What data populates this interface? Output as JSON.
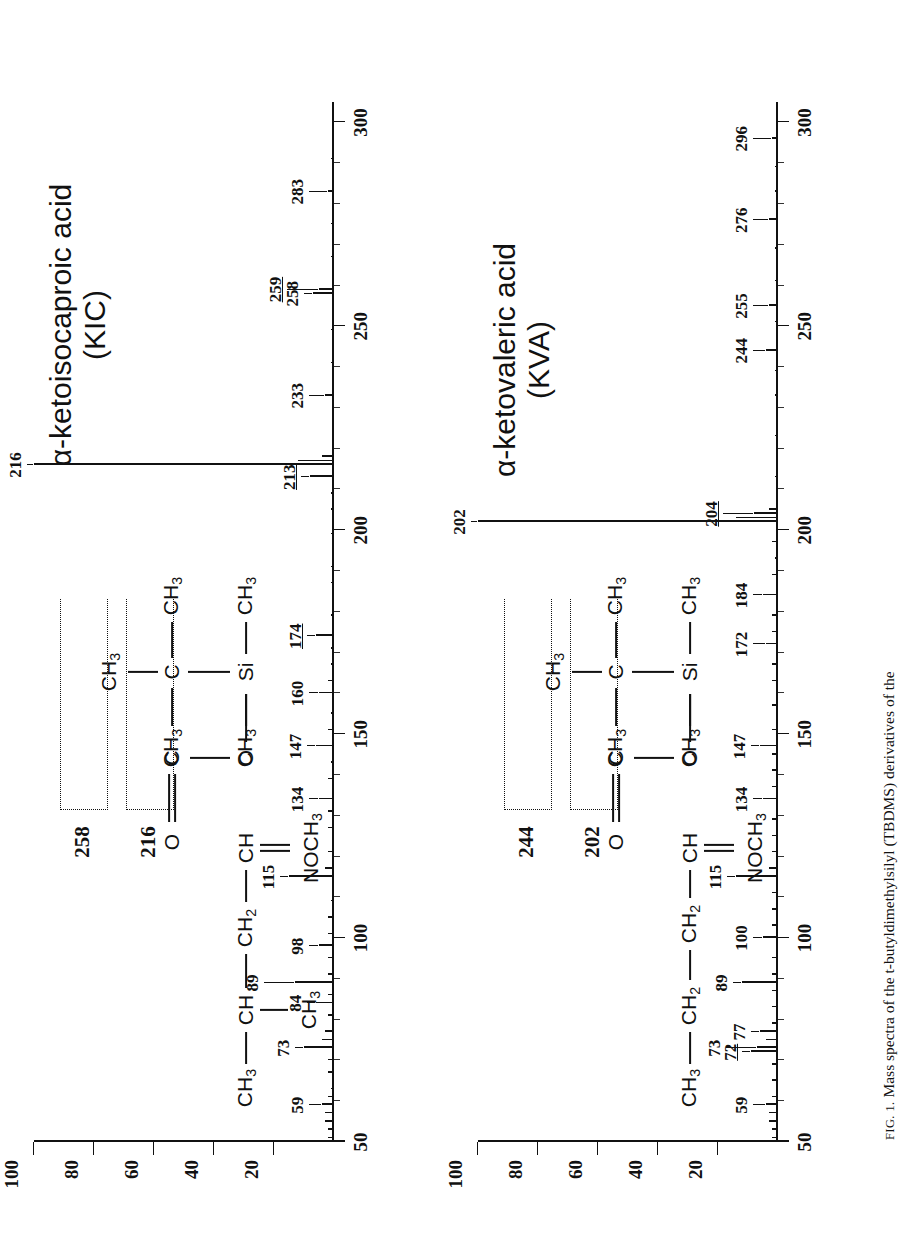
{
  "figure": {
    "caption_prefix": "FIG. 1.",
    "caption_text": "Mass spectra of the t-butyldimethylsilyl (TBDMS) derivatives of the"
  },
  "axes": {
    "y_label_values": [
      "100",
      "80",
      "60",
      "40",
      "20"
    ],
    "y_ticks": [
      100,
      80,
      60,
      40,
      20
    ],
    "x_label_values": [
      "50",
      "100",
      "150",
      "200",
      "250",
      "300"
    ],
    "x_ticks": [
      50,
      100,
      150,
      200,
      250,
      300
    ],
    "x_minor_step": 10,
    "xlim": [
      50,
      305
    ],
    "ylim": [
      0,
      100
    ]
  },
  "panels": [
    {
      "id": "kic",
      "title_line1": "α-ketoisocaproic acid",
      "title_line2": "(KIC)",
      "structure": {
        "chain": [
          "CH",
          "CH",
          "CH",
          "CH",
          "C",
          "O",
          "Si",
          "C",
          "CH"
        ],
        "atoms": {
          "ch3_start": "CH3",
          "ch_branch": "CH",
          "ch3_branch": "CH3",
          "ch2": "CH2",
          "ch_oxime": "CH",
          "nnoch3": "NOCH3",
          "c_carbonyl": "C",
          "o_double": "O",
          "o_single": "O",
          "si": "Si",
          "si_ch3_left": "CH3",
          "si_ch3_right": "CH3",
          "c_quart": "C",
          "c_ch3_left": "CH3",
          "c_ch3_right": "CH3",
          "c_ch3_top": "CH3"
        },
        "fragment_labels": [
          "216",
          "258"
        ]
      },
      "chart_data": {
        "type": "bar",
        "title": "α-ketoisocaproic acid (KIC)",
        "xlabel": "m/z",
        "ylabel": "Relative abundance (%)",
        "xlim": [
          50,
          305
        ],
        "ylim": [
          0,
          100
        ],
        "grid": false,
        "labeled_peaks": [
          {
            "mz": 59,
            "intensity": 4,
            "label": "59",
            "underline": false
          },
          {
            "mz": 73,
            "intensity": 10,
            "label": "73",
            "underline": false
          },
          {
            "mz": 84,
            "intensity": 6,
            "label": "84",
            "underline": false
          },
          {
            "mz": 89,
            "intensity": 13,
            "label": "89",
            "underline": false
          },
          {
            "mz": 98,
            "intensity": 5,
            "label": "98",
            "underline": false
          },
          {
            "mz": 115,
            "intensity": 15,
            "label": "115",
            "underline": false
          },
          {
            "mz": 134,
            "intensity": 5,
            "label": "134",
            "underline": false
          },
          {
            "mz": 147,
            "intensity": 6,
            "label": "147",
            "underline": false
          },
          {
            "mz": 160,
            "intensity": 5,
            "label": "160",
            "underline": false
          },
          {
            "mz": 174,
            "intensity": 6,
            "label": "174",
            "underline": true
          },
          {
            "mz": 213,
            "intensity": 8,
            "label": "213",
            "underline": true
          },
          {
            "mz": 216,
            "intensity": 100,
            "label": "216",
            "underline": false
          },
          {
            "mz": 233,
            "intensity": 3,
            "label": "233",
            "underline": false
          },
          {
            "mz": 258,
            "intensity": 7,
            "label": "258",
            "underline": false
          },
          {
            "mz": 259,
            "intensity": 5,
            "label": "259",
            "underline": true
          },
          {
            "mz": 283,
            "intensity": 2,
            "label": "283",
            "underline": false
          }
        ],
        "minor_peaks": [
          {
            "mz": 51,
            "intensity": 2
          },
          {
            "mz": 53,
            "intensity": 2
          },
          {
            "mz": 55,
            "intensity": 3
          },
          {
            "mz": 57,
            "intensity": 3
          },
          {
            "mz": 61,
            "intensity": 2
          },
          {
            "mz": 63,
            "intensity": 1
          },
          {
            "mz": 67,
            "intensity": 2
          },
          {
            "mz": 70,
            "intensity": 2
          },
          {
            "mz": 75,
            "intensity": 4
          },
          {
            "mz": 77,
            "intensity": 3
          },
          {
            "mz": 81,
            "intensity": 2
          },
          {
            "mz": 86,
            "intensity": 2
          },
          {
            "mz": 91,
            "intensity": 2
          },
          {
            "mz": 95,
            "intensity": 2
          },
          {
            "mz": 101,
            "intensity": 2
          },
          {
            "mz": 105,
            "intensity": 2
          },
          {
            "mz": 109,
            "intensity": 1
          },
          {
            "mz": 117,
            "intensity": 3
          },
          {
            "mz": 121,
            "intensity": 2
          },
          {
            "mz": 127,
            "intensity": 2
          },
          {
            "mz": 131,
            "intensity": 2
          },
          {
            "mz": 139,
            "intensity": 2
          },
          {
            "mz": 143,
            "intensity": 1
          },
          {
            "mz": 151,
            "intensity": 2
          },
          {
            "mz": 155,
            "intensity": 1
          },
          {
            "mz": 163,
            "intensity": 2
          },
          {
            "mz": 167,
            "intensity": 1
          },
          {
            "mz": 171,
            "intensity": 1
          },
          {
            "mz": 179,
            "intensity": 1
          },
          {
            "mz": 187,
            "intensity": 1
          },
          {
            "mz": 191,
            "intensity": 1
          },
          {
            "mz": 199,
            "intensity": 1
          },
          {
            "mz": 205,
            "intensity": 1
          },
          {
            "mz": 209,
            "intensity": 1
          },
          {
            "mz": 217,
            "intensity": 12
          },
          {
            "mz": 218,
            "intensity": 4
          },
          {
            "mz": 241,
            "intensity": 1
          },
          {
            "mz": 249,
            "intensity": 1
          },
          {
            "mz": 267,
            "intensity": 1
          },
          {
            "mz": 275,
            "intensity": 1
          },
          {
            "mz": 291,
            "intensity": 1
          }
        ]
      }
    },
    {
      "id": "kva",
      "title_line1": "α-ketovaleric acid",
      "title_line2": "(KVA)",
      "structure": {
        "atoms": {
          "ch3_start": "CH3",
          "ch2_a": "CH2",
          "ch2_b": "CH2",
          "ch_oxime": "CH",
          "nnoch3": "NOCH3",
          "c_carbonyl": "C",
          "o_double": "O",
          "o_single": "O",
          "si": "Si",
          "si_ch3_left": "CH3",
          "si_ch3_right": "CH3",
          "c_quart": "C",
          "c_ch3_left": "CH3",
          "c_ch3_right": "CH3",
          "c_ch3_top": "CH3"
        },
        "fragment_labels": [
          "202",
          "244"
        ]
      },
      "chart_data": {
        "type": "bar",
        "title": "α-ketovaleric acid (KVA)",
        "xlabel": "m/z",
        "ylabel": "Relative abundance (%)",
        "xlim": [
          50,
          305
        ],
        "ylim": [
          0,
          100
        ],
        "grid": false,
        "labeled_peaks": [
          {
            "mz": 59,
            "intensity": 4,
            "label": "59",
            "underline": false
          },
          {
            "mz": 72,
            "intensity": 9,
            "label": "72",
            "underline": true
          },
          {
            "mz": 73,
            "intensity": 7,
            "label": "73",
            "underline": false
          },
          {
            "mz": 77,
            "intensity": 6,
            "label": "77",
            "underline": false
          },
          {
            "mz": 89,
            "intensity": 12,
            "label": "89",
            "underline": false
          },
          {
            "mz": 100,
            "intensity": 5,
            "label": "100",
            "underline": false
          },
          {
            "mz": 115,
            "intensity": 14,
            "label": "115",
            "underline": false
          },
          {
            "mz": 134,
            "intensity": 5,
            "label": "134",
            "underline": false
          },
          {
            "mz": 147,
            "intensity": 6,
            "label": "147",
            "underline": false
          },
          {
            "mz": 172,
            "intensity": 4,
            "label": "172",
            "underline": false
          },
          {
            "mz": 184,
            "intensity": 5,
            "label": "184",
            "underline": false
          },
          {
            "mz": 202,
            "intensity": 100,
            "label": "202",
            "underline": false
          },
          {
            "mz": 204,
            "intensity": 8,
            "label": "204",
            "underline": true
          },
          {
            "mz": 244,
            "intensity": 4,
            "label": "244",
            "underline": false
          },
          {
            "mz": 255,
            "intensity": 3,
            "label": "255",
            "underline": false
          },
          {
            "mz": 276,
            "intensity": 3,
            "label": "276",
            "underline": false
          },
          {
            "mz": 296,
            "intensity": 2,
            "label": "296",
            "underline": false
          }
        ],
        "minor_peaks": [
          {
            "mz": 51,
            "intensity": 2
          },
          {
            "mz": 53,
            "intensity": 2
          },
          {
            "mz": 55,
            "intensity": 3
          },
          {
            "mz": 57,
            "intensity": 3
          },
          {
            "mz": 61,
            "intensity": 2
          },
          {
            "mz": 65,
            "intensity": 2
          },
          {
            "mz": 69,
            "intensity": 2
          },
          {
            "mz": 75,
            "intensity": 4
          },
          {
            "mz": 79,
            "intensity": 2
          },
          {
            "mz": 83,
            "intensity": 2
          },
          {
            "mz": 87,
            "intensity": 2
          },
          {
            "mz": 91,
            "intensity": 2
          },
          {
            "mz": 95,
            "intensity": 2
          },
          {
            "mz": 103,
            "intensity": 2
          },
          {
            "mz": 107,
            "intensity": 2
          },
          {
            "mz": 111,
            "intensity": 2
          },
          {
            "mz": 117,
            "intensity": 3
          },
          {
            "mz": 121,
            "intensity": 2
          },
          {
            "mz": 125,
            "intensity": 2
          },
          {
            "mz": 129,
            "intensity": 2
          },
          {
            "mz": 137,
            "intensity": 2
          },
          {
            "mz": 141,
            "intensity": 2
          },
          {
            "mz": 145,
            "intensity": 2
          },
          {
            "mz": 151,
            "intensity": 2
          },
          {
            "mz": 157,
            "intensity": 2
          },
          {
            "mz": 163,
            "intensity": 2
          },
          {
            "mz": 167,
            "intensity": 2
          },
          {
            "mz": 175,
            "intensity": 2
          },
          {
            "mz": 179,
            "intensity": 2
          },
          {
            "mz": 189,
            "intensity": 2
          },
          {
            "mz": 193,
            "intensity": 1
          },
          {
            "mz": 197,
            "intensity": 2
          },
          {
            "mz": 203,
            "intensity": 14
          },
          {
            "mz": 205,
            "intensity": 3
          },
          {
            "mz": 213,
            "intensity": 1
          },
          {
            "mz": 223,
            "intensity": 1
          },
          {
            "mz": 233,
            "intensity": 1
          },
          {
            "mz": 239,
            "intensity": 1
          },
          {
            "mz": 251,
            "intensity": 1
          },
          {
            "mz": 261,
            "intensity": 1
          },
          {
            "mz": 269,
            "intensity": 1
          },
          {
            "mz": 283,
            "intensity": 1
          },
          {
            "mz": 289,
            "intensity": 1
          }
        ]
      }
    }
  ]
}
